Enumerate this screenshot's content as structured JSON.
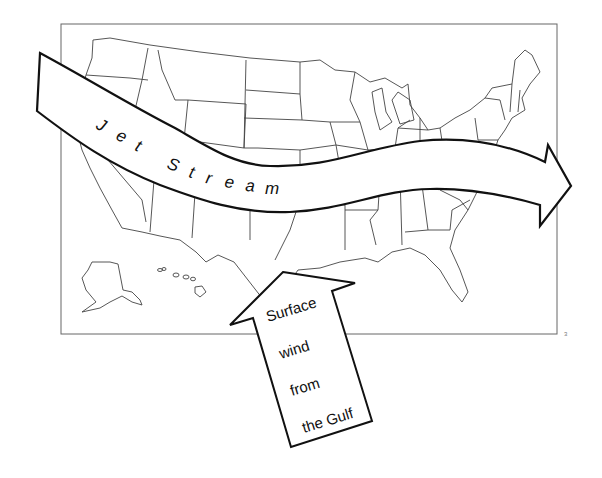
{
  "diagram": {
    "jet_stream": {
      "label": "Jet Stream",
      "letters": [
        "J",
        "e",
        "t",
        "S",
        "t",
        "r",
        "e",
        "a",
        "m"
      ],
      "direction": "west-to-east"
    },
    "surface_wind": {
      "lines": [
        "Surface",
        "wind",
        "from",
        "the Gulf"
      ],
      "direction": "north-west from the Gulf of Mexico"
    },
    "page_number": "3",
    "colors": {
      "outline": "#111111",
      "state_lines": "#444444",
      "frame": "#666666",
      "background": "#ffffff"
    }
  }
}
